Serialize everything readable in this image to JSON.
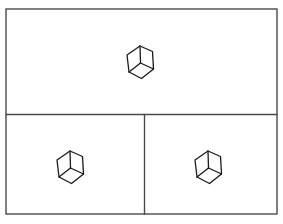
{
  "canvas": {
    "width": 283,
    "height": 224,
    "background_color": "#ffffff"
  },
  "frame": {
    "name": "outer-frame",
    "x": 6,
    "y": 9,
    "width": 271,
    "height": 205,
    "stroke_color": "#4a4a4a",
    "stroke_width": 1.4,
    "fill_color": "#ffffff"
  },
  "dividers": [
    {
      "name": "horizontal-divider",
      "orientation": "horizontal",
      "x1": 6,
      "y1": 114.5,
      "x2": 277,
      "y2": 114.5,
      "stroke_color": "#4a4a4a",
      "stroke_width": 1.4
    },
    {
      "name": "vertical-divider",
      "orientation": "vertical",
      "x1": 144.5,
      "y1": 114.5,
      "x2": 144.5,
      "y2": 214,
      "stroke_color": "#4a4a4a",
      "stroke_width": 1.4
    }
  ],
  "panels": [
    {
      "name": "top-panel",
      "label": "top",
      "x": 6,
      "y": 9,
      "width": 271,
      "height": 105.5,
      "cube_count": 1
    },
    {
      "name": "bottom-left-panel",
      "label": "bottom-left",
      "x": 6,
      "y": 114.5,
      "width": 138.5,
      "height": 99.5,
      "cube_count": 1
    },
    {
      "name": "bottom-right-panel",
      "label": "bottom-right",
      "x": 144.5,
      "y": 114.5,
      "width": 132.5,
      "height": 99.5,
      "cube_count": 1
    }
  ],
  "cubes": [
    {
      "name": "cube-top",
      "panel": "top-panel",
      "center_x": 140,
      "center_y": 62,
      "scale": 1.0,
      "stroke_color": "#1a1a1a",
      "stroke_width": 1.3
    },
    {
      "name": "cube-bottom-left",
      "panel": "bottom-left-panel",
      "center_x": 70,
      "center_y": 167,
      "scale": 1.0,
      "stroke_color": "#1a1a1a",
      "stroke_width": 1.3
    },
    {
      "name": "cube-bottom-right",
      "panel": "bottom-right-panel",
      "center_x": 208,
      "center_y": 167,
      "scale": 1.0,
      "stroke_color": "#1a1a1a",
      "stroke_width": 1.3
    }
  ],
  "cube_geometry": {
    "description": "isometric cube rendered as hexagonal outline with three internal edges meeting at center",
    "outline_points": "0,-16 12.5,-10.5 13.5,7 1.5,16.5 -11,10 -13,-7",
    "inner_edges": [
      {
        "from_x": 0,
        "from_y": -16,
        "to_x": 0.5,
        "to_y": 1
      },
      {
        "from_x": 0.5,
        "from_y": 1,
        "to_x": 13.5,
        "to_y": 7
      },
      {
        "from_x": 0.5,
        "from_y": 1,
        "to_x": -11,
        "to_y": 10
      }
    ]
  }
}
